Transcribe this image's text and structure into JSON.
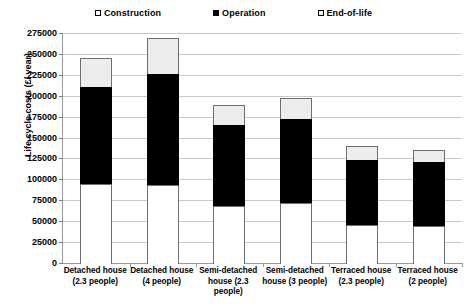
{
  "chart_data": {
    "type": "bar",
    "subtype": "stacked-bar",
    "title": "",
    "xlabel": "",
    "ylabel": "Life cycle costs (£/ year)",
    "ylim": [
      0,
      275000
    ],
    "ytick_step": 25000,
    "ytick_labels": [
      "0",
      "25000",
      "50000",
      "75000",
      "100000",
      "125000",
      "150000",
      "175000",
      "200000",
      "225000",
      "250000",
      "275000"
    ],
    "grid": true,
    "legend_position": "top",
    "categories": [
      "Detached house (2.3 people)",
      "Detached house (4 people)",
      "Semi-detached house (2.3 people)",
      "Semi-detached house (3 people)",
      "Terraced house (2.3 people)",
      "Terraced house (2 people)"
    ],
    "series": [
      {
        "name": "Construction",
        "color": "#ffffff",
        "values": [
          95700,
          94500,
          69400,
          73000,
          46600,
          45400
        ]
      },
      {
        "name": "Operation",
        "color": "#000000",
        "values": [
          117200,
          134000,
          98000,
          101600,
          79000,
          77800
        ]
      },
      {
        "name": "End-of-life",
        "color": "#ececec",
        "values": [
          35900,
          44200,
          25200,
          26300,
          17900,
          15500
        ]
      }
    ],
    "totals": [
      248800,
      272700,
      192600,
      200900,
      143500,
      138700
    ]
  },
  "legend": {
    "items": [
      {
        "label": "Construction",
        "swatch": "square-outline-white"
      },
      {
        "label": "Operation",
        "swatch": "square-filled-black"
      },
      {
        "label": "End-of-life",
        "swatch": "square-outline-lightgray"
      }
    ]
  },
  "axis": {
    "y_title": "Life cycle costs (£/ year)"
  },
  "x_labels": [
    [
      "Detached house",
      "(2.3 people)"
    ],
    [
      "Detached house",
      "(4 people)"
    ],
    [
      "Semi-detached",
      "house (2.3",
      "people)"
    ],
    [
      "Semi-detached",
      "house (3 people)"
    ],
    [
      "Terraced house",
      "(2.3 people)"
    ],
    [
      "Terraced house",
      "(2 people)"
    ]
  ]
}
